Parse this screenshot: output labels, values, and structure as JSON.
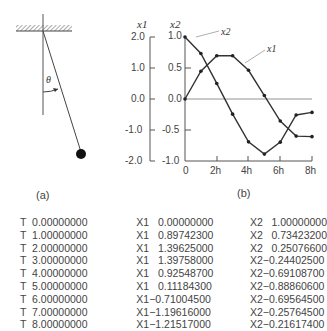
{
  "figure_a": {
    "caption": "(a)",
    "angle_label": "θ"
  },
  "figure_b": {
    "caption": "(b)",
    "y1_axis_label": "x1",
    "y2_axis_label": "x2",
    "curve_labels": {
      "x1": "x1",
      "x2": "x2"
    }
  },
  "chart_data": {
    "type": "line",
    "title": "",
    "xlabel": "",
    "x_tick_labels": [
      "0",
      "2h",
      "4h",
      "6h",
      "8h"
    ],
    "x": [
      0,
      1,
      2,
      3,
      4,
      5,
      6,
      7,
      8
    ],
    "y1_axis": {
      "label": "x1",
      "ticks": [
        "2.0",
        "1.0",
        "0.0",
        "-1.0",
        "-2.0"
      ],
      "range": [
        -2.0,
        2.0
      ]
    },
    "y2_axis": {
      "label": "x2",
      "ticks": [
        "1.0",
        "0.5",
        "0.0",
        "-0.5",
        "-1.0"
      ],
      "range": [
        -1.0,
        1.0
      ]
    },
    "series": [
      {
        "name": "x1",
        "axis": "y1",
        "values": [
          0.0,
          0.897423,
          1.39625,
          1.39758,
          0.925487,
          0.111843,
          -0.710045,
          -1.19616,
          -1.21517
        ]
      },
      {
        "name": "x2",
        "axis": "y2",
        "values": [
          1.0,
          0.734232,
          0.250766,
          -0.244025,
          -0.691087,
          -0.888606,
          -0.695645,
          -0.257645,
          -0.216174
        ]
      }
    ],
    "grid": false
  },
  "table": {
    "rows": [
      {
        "t": "T  0.00000000",
        "x1": "X1   0.00000000",
        "x2": "X2   1.00000000"
      },
      {
        "t": "T  1.00000000",
        "x1": "X1   0.89742300",
        "x2": "X2   0.73423200"
      },
      {
        "t": "T  2.00000000",
        "x1": "X1   1.39625000",
        "x2": "X2   0.25076600"
      },
      {
        "t": "T  3.00000000",
        "x1": "X1   1.39758000",
        "x2": "X2−0.24402500"
      },
      {
        "t": "T  4.00000000",
        "x1": "X1   0.92548700",
        "x2": "X2−0.69108700"
      },
      {
        "t": "T  5.00000000",
        "x1": "X1   0.11184300",
        "x2": "X2−0.88860600"
      },
      {
        "t": "T  6.00000000",
        "x1": "X1−0.71004500",
        "x2": "X2−0.69564500"
      },
      {
        "t": "T  7.00000000",
        "x1": "X1−1.19616000",
        "x2": "X2−0.25764500"
      },
      {
        "t": "T  8.00000000",
        "x1": "X1−1.21517000",
        "x2": "X2−0.21617400"
      }
    ]
  }
}
